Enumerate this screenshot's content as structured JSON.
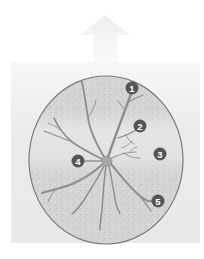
{
  "diagram": {
    "colors": {
      "background": "#ffffff",
      "panel": "#ececec",
      "arrow": "#f0f0f0",
      "retina_fill": "#d6d6d6",
      "retina_band": "#e4e4e4",
      "retina_outline": "#7a7a7a",
      "vessel": "#8e8e8e",
      "optic_disc": "#a8a8a8",
      "marker": "#555555",
      "marker_text": "#ffffff"
    },
    "markers": [
      {
        "label": "1",
        "x": 132,
        "y": 88
      },
      {
        "label": "2",
        "x": 140,
        "y": 126
      },
      {
        "label": "3",
        "x": 160,
        "y": 154
      },
      {
        "label": "4",
        "x": 78,
        "y": 161
      },
      {
        "label": "5",
        "x": 158,
        "y": 201
      }
    ]
  }
}
